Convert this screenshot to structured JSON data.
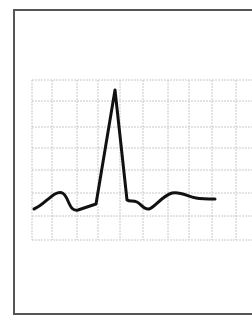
{
  "diagram": {
    "type": "ecg-waveform",
    "colors": {
      "background": "#ffffff",
      "frame": "#555555",
      "grid": "#c8c8c8",
      "trace": "#111111"
    },
    "frame": {
      "x": 14,
      "y": 10,
      "width": 250,
      "height": 304
    },
    "grid": {
      "x_lines": [
        32,
        52,
        77,
        98,
        120,
        143,
        168,
        189,
        212,
        236
      ],
      "y_lines": [
        80,
        101,
        127,
        148,
        170,
        193,
        216,
        240
      ],
      "x_start": 32,
      "x_end": 252,
      "y_start": 80,
      "y_end": 240
    },
    "trace": {
      "stroke_width": 3,
      "path": "M34,209 C42,206 48,198 55,194 C62,190 65,194 68,201 C71,208 73,211 78,210 L96,204 L115,90 L127,200 C130,202 133,200 137,202 C141,204 144,210 149,209 C155,207 162,196 172,193 C181,191 188,197 196,198 C202,199 208,199 215,199",
      "segments": [
        "baseline",
        "P wave",
        "PR segment",
        "QRS complex",
        "ST segment",
        "T wave",
        "baseline"
      ]
    }
  }
}
